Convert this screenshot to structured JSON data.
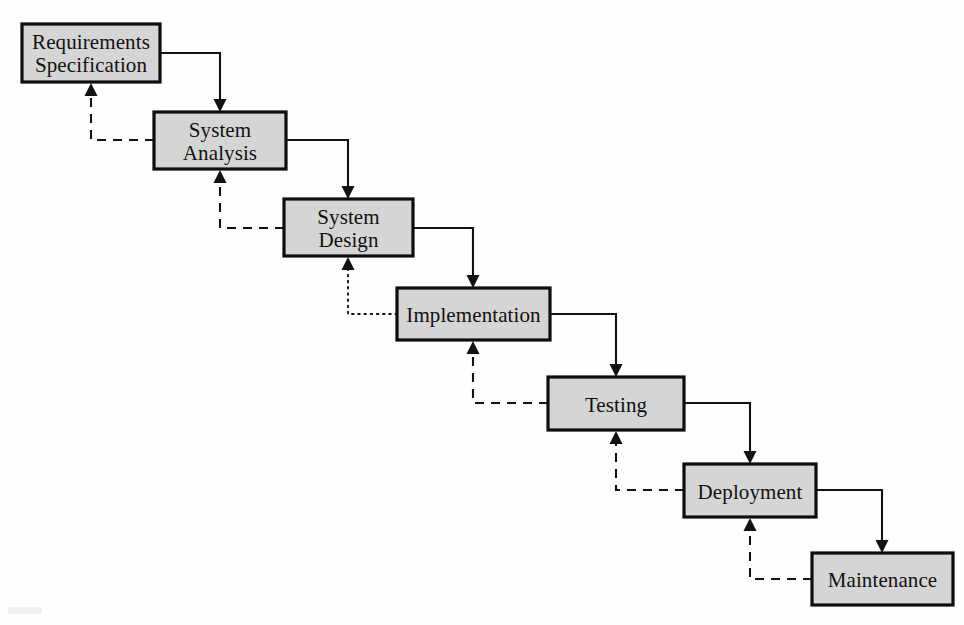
{
  "diagram": {
    "type": "flowchart",
    "background_color": "#fefefe",
    "box_fill_color": "#d5d5d5",
    "box_border_color": "#0d0d0d",
    "line_color": "#121212",
    "stages": [
      {
        "id": "requirements-specification",
        "label_line1": "Requirements",
        "label_line2": "Specification",
        "x": 22,
        "y": 24,
        "width": 138,
        "height": 58,
        "lines": 2
      },
      {
        "id": "system-analysis",
        "label_line1": "System",
        "label_line2": "Analysis",
        "x": 154,
        "y": 112,
        "width": 132,
        "height": 57,
        "lines": 2
      },
      {
        "id": "system-design",
        "label_line1": "System",
        "label_line2": "Design",
        "x": 284,
        "y": 199,
        "width": 129,
        "height": 57,
        "lines": 2
      },
      {
        "id": "implementation",
        "label_line1": "Implementation",
        "label_line2": "",
        "x": 397,
        "y": 288,
        "width": 153,
        "height": 52,
        "lines": 1
      },
      {
        "id": "testing",
        "label_line1": "Testing",
        "label_line2": "",
        "x": 548,
        "y": 377,
        "width": 136,
        "height": 53,
        "lines": 1
      },
      {
        "id": "deployment",
        "label_line1": "Deployment",
        "label_line2": "",
        "x": 684,
        "y": 464,
        "width": 132,
        "height": 53,
        "lines": 1
      },
      {
        "id": "maintenance",
        "label_line1": "Maintenance",
        "label_line2": "",
        "x": 812,
        "y": 553,
        "width": 141,
        "height": 52,
        "lines": 1
      }
    ],
    "forward_connectors": [
      {
        "id": "requirements-to-analysis",
        "from": "requirements-specification",
        "to": "system-analysis",
        "style": "solid",
        "corner_x": 220,
        "exit_y": 53,
        "enter_x": 220
      },
      {
        "id": "analysis-to-design",
        "from": "system-analysis",
        "to": "system-design",
        "style": "solid",
        "corner_x": 348,
        "exit_y": 140,
        "enter_x": 348
      },
      {
        "id": "design-to-implementation",
        "from": "system-design",
        "to": "implementation",
        "style": "solid",
        "corner_x": 473,
        "exit_y": 228,
        "enter_x": 473
      },
      {
        "id": "implementation-to-testing",
        "from": "implementation",
        "to": "testing",
        "style": "solid",
        "corner_x": 616,
        "exit_y": 314,
        "enter_x": 616
      },
      {
        "id": "testing-to-deployment",
        "from": "testing",
        "to": "deployment",
        "style": "solid",
        "corner_x": 750,
        "exit_y": 403,
        "enter_x": 750
      },
      {
        "id": "deployment-to-maintenance",
        "from": "deployment",
        "to": "maintenance",
        "style": "solid",
        "corner_x": 882,
        "exit_y": 490,
        "enter_x": 882
      }
    ],
    "feedback_connectors": [
      {
        "id": "analysis-to-requirements",
        "from": "system-analysis",
        "to": "requirements-specification",
        "style": "dashed",
        "corner_x": 91,
        "exit_y": 140,
        "enter_x": 91
      },
      {
        "id": "design-to-analysis",
        "from": "system-design",
        "to": "system-analysis",
        "style": "dashed",
        "corner_x": 220,
        "exit_y": 228,
        "enter_x": 220
      },
      {
        "id": "implementation-to-design",
        "from": "implementation",
        "to": "system-design",
        "style": "dotted",
        "corner_x": 348,
        "exit_y": 314,
        "enter_x": 348
      },
      {
        "id": "testing-to-implementation",
        "from": "testing",
        "to": "implementation",
        "style": "dashed",
        "corner_x": 473,
        "exit_y": 403,
        "enter_x": 473
      },
      {
        "id": "deployment-to-testing",
        "from": "deployment",
        "to": "testing",
        "style": "dashed",
        "corner_x": 616,
        "exit_y": 490,
        "enter_x": 616
      },
      {
        "id": "maintenance-to-deployment",
        "from": "maintenance",
        "to": "deployment",
        "style": "dashed",
        "corner_x": 750,
        "exit_y": 579,
        "enter_x": 750
      }
    ]
  }
}
